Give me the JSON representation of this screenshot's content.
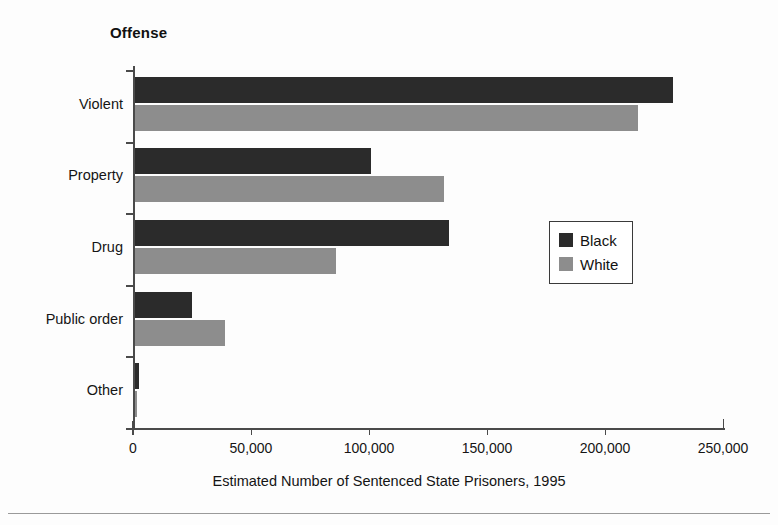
{
  "chart_data": {
    "type": "bar",
    "orientation": "horizontal",
    "title": "Offense",
    "xlabel": "Estimated Number of Sentenced State Prisoners, 1995",
    "ylabel": "Offense",
    "categories": [
      "Violent",
      "Property",
      "Drug",
      "Public order",
      "Other"
    ],
    "series": [
      {
        "name": "Black",
        "color": "#2b2b2b",
        "values": [
          228000,
          100000,
          133000,
          24000,
          1500
        ]
      },
      {
        "name": "White",
        "color": "#8d8d8d",
        "values": [
          213000,
          131000,
          85000,
          38000,
          500
        ]
      }
    ],
    "xlim": [
      0,
      250000
    ],
    "xticks": [
      0,
      50000,
      100000,
      150000,
      200000,
      250000
    ],
    "xticklabels": [
      "0",
      "50,000",
      "100,000",
      "150,000",
      "200,000",
      "250,000"
    ],
    "grid": false,
    "legend_position": "center-right",
    "legend_entries": [
      "Black",
      "White"
    ]
  },
  "colors": {
    "black_series": "#2b2b2b",
    "white_series": "#8d8d8d",
    "axis": "#4a4a4a",
    "text": "#151515",
    "background": "#fdfdfd"
  }
}
